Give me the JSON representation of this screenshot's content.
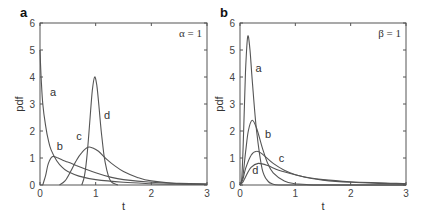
{
  "chart_data": [
    {
      "type": "line",
      "panel": "a",
      "annotation": "α = 1",
      "title": "",
      "xlabel": "t",
      "ylabel": "pdf",
      "xlim": [
        0,
        3
      ],
      "ylim": [
        0,
        6
      ],
      "xticks": [
        0,
        1,
        2,
        3
      ],
      "yticks": [
        0,
        1,
        2,
        3,
        4,
        5,
        6
      ],
      "grid": false,
      "legend": "none (inline curve labels)",
      "series": [
        {
          "name": "a",
          "label_pos": [
            0.18,
            3.3
          ],
          "x": [
            0,
            0.02,
            0.05,
            0.1,
            0.15,
            0.2,
            0.3,
            0.4,
            0.5,
            0.7,
            1.0,
            1.5,
            2.0,
            2.5,
            3.0
          ],
          "y": [
            5.0,
            4.0,
            3.0,
            2.2,
            1.65,
            1.3,
            0.9,
            0.65,
            0.5,
            0.33,
            0.2,
            0.1,
            0.05,
            0.03,
            0.02
          ]
        },
        {
          "name": "b",
          "label_pos": [
            0.3,
            1.3
          ],
          "x": [
            0.05,
            0.1,
            0.15,
            0.22,
            0.3,
            0.4,
            0.5,
            0.65,
            0.8,
            1.0,
            1.25,
            1.5,
            2.0,
            2.5,
            3.0
          ],
          "y": [
            0,
            0.35,
            0.8,
            1.05,
            1.02,
            0.93,
            0.85,
            0.72,
            0.6,
            0.45,
            0.3,
            0.2,
            0.1,
            0.06,
            0.04
          ]
        },
        {
          "name": "c",
          "label_pos": [
            0.65,
            1.65
          ],
          "x": [
            0.35,
            0.45,
            0.55,
            0.65,
            0.75,
            0.86,
            0.95,
            1.05,
            1.2,
            1.35,
            1.5,
            1.75,
            2.0,
            2.5,
            3.0
          ],
          "y": [
            0,
            0.15,
            0.5,
            0.9,
            1.2,
            1.4,
            1.37,
            1.25,
            0.95,
            0.7,
            0.5,
            0.28,
            0.15,
            0.05,
            0.02
          ]
        },
        {
          "name": "d",
          "label_pos": [
            1.15,
            2.45
          ],
          "x": [
            0.75,
            0.8,
            0.85,
            0.9,
            0.94,
            0.98,
            1.02,
            1.06,
            1.1,
            1.15,
            1.2,
            1.25,
            1.3,
            1.4
          ],
          "y": [
            0,
            0.35,
            1.2,
            2.5,
            3.5,
            4.0,
            3.7,
            2.9,
            2.0,
            1.1,
            0.55,
            0.22,
            0.08,
            0
          ]
        }
      ]
    },
    {
      "type": "line",
      "panel": "b",
      "annotation": "β = 1",
      "title": "",
      "xlabel": "t",
      "ylabel": "pdf",
      "xlim": [
        0,
        3
      ],
      "ylim": [
        0,
        6
      ],
      "xticks": [
        0,
        1,
        2,
        3
      ],
      "yticks": [
        0,
        1,
        2,
        3,
        4,
        5,
        6
      ],
      "grid": false,
      "legend": "none (inline curve labels)",
      "series": [
        {
          "name": "a",
          "label_pos": [
            0.28,
            4.2
          ],
          "x": [
            0,
            0.03,
            0.06,
            0.1,
            0.14,
            0.18,
            0.22,
            0.3,
            0.4,
            0.5,
            0.6,
            0.7,
            1.0,
            3.0
          ],
          "y": [
            0,
            0.2,
            1.6,
            4.2,
            5.5,
            5.0,
            3.9,
            2.0,
            0.6,
            0.15,
            0.03,
            0,
            0,
            0
          ]
        },
        {
          "name": "b",
          "label_pos": [
            0.45,
            1.75
          ],
          "x": [
            0,
            0.05,
            0.1,
            0.15,
            0.22,
            0.3,
            0.4,
            0.5,
            0.6,
            0.8,
            1.0,
            1.2,
            1.5,
            3.0
          ],
          "y": [
            0,
            0.3,
            1.2,
            2.0,
            2.4,
            2.1,
            1.4,
            0.8,
            0.45,
            0.15,
            0.05,
            0.02,
            0,
            0
          ]
        },
        {
          "name": "c",
          "label_pos": [
            0.7,
            0.85
          ],
          "x": [
            0,
            0.05,
            0.1,
            0.2,
            0.3,
            0.4,
            0.6,
            0.8,
            1.0,
            1.25,
            1.5,
            2.0,
            2.5,
            3.0
          ],
          "y": [
            0,
            0.2,
            0.6,
            1.1,
            1.25,
            1.15,
            0.8,
            0.55,
            0.38,
            0.26,
            0.18,
            0.1,
            0.06,
            0.04
          ]
        },
        {
          "name": "d",
          "label_pos": [
            0.22,
            0.4
          ],
          "x": [
            0,
            0.05,
            0.1,
            0.2,
            0.33,
            0.5,
            0.7,
            1.0,
            1.25,
            1.5,
            2.0,
            2.5,
            3.0
          ],
          "y": [
            0,
            0.1,
            0.3,
            0.65,
            0.8,
            0.72,
            0.55,
            0.38,
            0.27,
            0.2,
            0.12,
            0.08,
            0.05
          ]
        }
      ]
    }
  ],
  "panels": [
    {
      "label": "a",
      "annotation": "α = 1",
      "xlabel": "t",
      "ylabel": "pdf"
    },
    {
      "label": "b",
      "annotation": "β = 1",
      "xlabel": "t",
      "ylabel": "pdf"
    }
  ],
  "colors": {
    "curve": "#555555",
    "axis": "#555555",
    "text": "#333333"
  }
}
